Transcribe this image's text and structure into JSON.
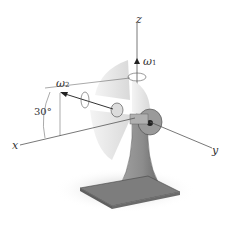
{
  "diagram": {
    "axes": {
      "x_label": "x",
      "y_label": "y",
      "z_label": "z"
    },
    "angular_velocities": [
      {
        "symbol": "ω",
        "subscript": "1",
        "axis": "z"
      },
      {
        "symbol": "ω",
        "subscript": "2",
        "axis": "fan shaft"
      }
    ],
    "angle_label": "30°",
    "colors": {
      "axis_line": "#555555",
      "blade": "#e6e6e6",
      "stand": "#8a8a8a",
      "base": "#7d7d7d"
    }
  }
}
